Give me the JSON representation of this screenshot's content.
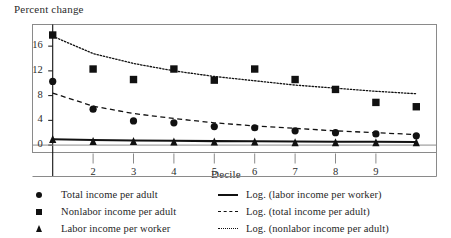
{
  "chart_data": {
    "type": "scatter",
    "title": "",
    "xlabel": "Decile",
    "ylabel": "Percent change",
    "xlim": [
      0.5,
      10.5
    ],
    "ylim": [
      -1.2,
      19.5
    ],
    "grid": false,
    "legend_position": "below",
    "x": [
      1,
      2,
      3,
      4,
      5,
      6,
      7,
      8,
      9,
      10
    ],
    "xticks": [
      2,
      3,
      4,
      5,
      6,
      7,
      8,
      9
    ],
    "xtick_labels": [
      "2",
      "3",
      "4",
      "5",
      "6",
      "7",
      "8",
      "9"
    ],
    "yticks": [
      0,
      4,
      8,
      12,
      16
    ],
    "ytick_labels": [
      "0",
      "4",
      "8",
      "12",
      "16"
    ],
    "series": [
      {
        "name": "Total income per adult",
        "marker": "circle",
        "values": [
          10.3,
          5.8,
          3.9,
          3.6,
          3.0,
          2.8,
          2.3,
          2.0,
          1.8,
          1.5
        ]
      },
      {
        "name": "Nonlabor income per adult",
        "marker": "square",
        "values": [
          17.8,
          12.3,
          10.6,
          12.3,
          10.5,
          12.3,
          10.6,
          9.0,
          6.9,
          6.2
        ]
      },
      {
        "name": "Labor income per worker",
        "marker": "triangle",
        "values": [
          0.9,
          0.6,
          0.6,
          0.5,
          0.5,
          0.5,
          0.4,
          0.4,
          0.4,
          0.4
        ]
      },
      {
        "name": "Log. (labor income per worker)",
        "line": "solid",
        "values": [
          0.95,
          0.82,
          0.74,
          0.69,
          0.64,
          0.61,
          0.58,
          0.55,
          0.53,
          0.51
        ]
      },
      {
        "name": "Log. (total income per adult)",
        "line": "dashed",
        "values": [
          8.4,
          6.3,
          5.1,
          4.3,
          3.6,
          3.1,
          2.7,
          2.3,
          2.0,
          1.7
        ]
      },
      {
        "name": "Log. (nonlabor income per adult)",
        "line": "dotted",
        "values": [
          17.6,
          14.8,
          13.2,
          12.0,
          11.1,
          10.4,
          9.7,
          9.2,
          8.7,
          8.3
        ]
      }
    ]
  },
  "legend": {
    "markers": [
      {
        "key": "circle",
        "label": "Total income per adult"
      },
      {
        "key": "square",
        "label": "Nonlabor income per adult"
      },
      {
        "key": "triangle",
        "label": "Labor income per worker"
      }
    ],
    "lines": [
      {
        "key": "solid",
        "label": "Log. (labor income per worker)"
      },
      {
        "key": "dashed",
        "label": "Log. (total income per adult)"
      },
      {
        "key": "dotted",
        "label": "Log. (nonlabor income per adult)"
      }
    ]
  },
  "colors": {
    "ink": "#111111",
    "frame": "#8a8a8a",
    "background": "#ffffff"
  }
}
